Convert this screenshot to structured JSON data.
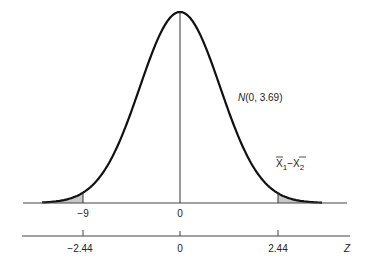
{
  "chart_data": {
    "type": "area",
    "title": "",
    "distribution_label": "N(0, 3.69)",
    "curve_label_var": "X̄₁ − X̄₂",
    "curve_label_parts": {
      "x1": "X",
      "sub1": "1",
      "minus": "−",
      "x2": "X",
      "sub2": "2"
    },
    "mean": 0,
    "variance": 3.69,
    "shaded_regions": [
      "lower tail below -9 (z = -2.44)",
      "upper tail above 9 (z = 2.44)"
    ],
    "upper_axis": {
      "ticks": [
        "−9",
        "0"
      ],
      "values": [
        -9,
        0
      ]
    },
    "lower_axis": {
      "label": "Z",
      "ticks": [
        "−2.44",
        "0",
        "2.44"
      ],
      "values": [
        -2.44,
        0,
        2.44
      ]
    },
    "xlabel": "Z",
    "ylabel": ""
  }
}
